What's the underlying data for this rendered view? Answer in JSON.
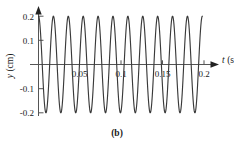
{
  "figure": {
    "caption": "(b)"
  },
  "chart_data": {
    "type": "line",
    "title": "",
    "subtitle": "",
    "xlabel": "t (s)",
    "xlabel_symbol": "t",
    "xlabel_unit": "(s)",
    "ylabel": "y (cm)",
    "ylabel_symbol": "y",
    "ylabel_unit": "(cm)",
    "xlim": [
      0,
      0.212
    ],
    "ylim": [
      -0.22,
      0.22
    ],
    "grid": false,
    "legend": false,
    "legend_position": "none",
    "xticks": [
      0.05,
      0.1,
      0.15,
      0.2
    ],
    "xtick_labels": [
      "0.05",
      "0.1",
      "0.15",
      "0.2"
    ],
    "yticks": [
      0.2,
      0.1,
      -0.1,
      -0.2
    ],
    "ytick_labels": [
      "0.2",
      "0.1",
      "-0.1",
      "-0.2"
    ],
    "waveform": {
      "form": "cosine",
      "amplitude_cm": 0.2,
      "period_s": 0.018,
      "frequency_hz": 55.6,
      "cycles_shown": 11,
      "phase": "starts at maximum",
      "t_start_s": 0,
      "t_end_s": 0.2
    },
    "series": [
      {
        "name": "y(t)",
        "x": [
          0,
          0.0045,
          0.009,
          0.0135,
          0.018,
          0.0225,
          0.027,
          0.0315,
          0.036,
          0.0405,
          0.045,
          0.0495,
          0.054,
          0.0585,
          0.063,
          0.0675,
          0.072,
          0.0765,
          0.081,
          0.0855,
          0.09,
          0.0945,
          0.099,
          0.1035,
          0.108,
          0.1125,
          0.117,
          0.1215,
          0.126,
          0.1305,
          0.135,
          0.1395,
          0.144,
          0.1485,
          0.153,
          0.1575,
          0.162,
          0.1665,
          0.171,
          0.1755,
          0.18,
          0.1845,
          0.189,
          0.1935,
          0.198
        ],
        "y": [
          0.2,
          0,
          -0.2,
          0,
          0.2,
          0,
          -0.2,
          0,
          0.2,
          0,
          -0.2,
          0,
          0.2,
          0,
          -0.2,
          0,
          0.2,
          0,
          -0.2,
          0,
          0.2,
          0,
          -0.2,
          0,
          0.2,
          0,
          -0.2,
          0,
          0.2,
          0,
          -0.2,
          0,
          0.2,
          0,
          -0.2,
          0,
          0.2,
          0,
          -0.2,
          0,
          0.2,
          0,
          -0.2,
          0,
          0.2
        ]
      }
    ]
  }
}
